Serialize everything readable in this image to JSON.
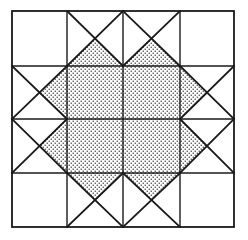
{
  "figure": {
    "name": "quilt-block-diagram",
    "canvas": {
      "width": 248,
      "height": 240
    },
    "background_color": "#ffffff",
    "line_color": "#1a1a1a",
    "fill_color": "#ffffff",
    "stipple_color": "#333333",
    "outer_line_width": 1.8,
    "grid_line_width": 1.4,
    "star_line_width": 1.8
  },
  "geometry": {
    "outer_square": {
      "left": 12,
      "top": 11,
      "right": 234,
      "bottom": 227
    },
    "grid_columns_x": [
      12,
      67,
      123,
      180,
      234
    ],
    "grid_rows_y": [
      11,
      66,
      119,
      173,
      227
    ],
    "center_x": 123,
    "center_y": 119,
    "star_center_square": {
      "left": 67,
      "top": 66,
      "right": 180,
      "bottom": 173
    },
    "star_points": [
      {
        "name": "point-top",
        "tip_x": 123,
        "tip_y": 11,
        "base_left_x": 67,
        "base_right_x": 180,
        "base_y": 66
      },
      {
        "name": "point-bottom",
        "tip_x": 123,
        "tip_y": 227,
        "base_left_x": 67,
        "base_right_x": 180,
        "base_y": 173
      },
      {
        "name": "point-left",
        "tip_x": 12,
        "tip_y": 119,
        "base_top_y": 66,
        "base_bottom_y": 173,
        "base_x": 67
      },
      {
        "name": "point-right",
        "tip_x": 234,
        "tip_y": 119,
        "base_top_y": 66,
        "base_bottom_y": 173,
        "base_x": 180
      }
    ],
    "notches": [
      {
        "name": "notch-top",
        "apex_x": 123,
        "apex_y": 66
      },
      {
        "name": "notch-bottom",
        "apex_x": 123,
        "apex_y": 173
      },
      {
        "name": "notch-left",
        "apex_x": 67,
        "apex_y": 119
      },
      {
        "name": "notch-right",
        "apex_x": 180,
        "apex_y": 119
      }
    ],
    "corner_patches": [
      {
        "name": "corner-top-left",
        "left": 12,
        "top": 11,
        "right": 67,
        "bottom": 66
      },
      {
        "name": "corner-top-right",
        "left": 180,
        "top": 11,
        "right": 234,
        "bottom": 66
      },
      {
        "name": "corner-bottom-left",
        "left": 12,
        "top": 173,
        "right": 67,
        "bottom": 227
      },
      {
        "name": "corner-bottom-right",
        "left": 180,
        "top": 173,
        "right": 234,
        "bottom": 227
      }
    ]
  },
  "shapes": {
    "star_body_path": "M 123 11 L 180 66 L 234 119 L 180 173 L 123 227 L 67 173 L 12 119 L 67 66 Z",
    "shaded_regions": [
      {
        "name": "star-octagon-body",
        "path": "M 123 11 L 180 66 L 234 119 L 180 173 L 123 227 L 67 173 L 12 119 L 67 66 Z",
        "shaded": true
      },
      {
        "name": "notch-top-cut",
        "path": "M 67 11 L 123 66 L 180 11 Z",
        "shaded": false
      },
      {
        "name": "notch-bottom-cut",
        "path": "M 67 227 L 123 173 L 180 227 Z",
        "shaded": false
      },
      {
        "name": "notch-left-cut",
        "path": "M 12 66 L 67 119 L 12 173 Z",
        "shaded": false
      },
      {
        "name": "notch-right-cut",
        "path": "M 234 66 L 180 119 L 234 173 Z",
        "shaded": false
      }
    ]
  },
  "grid_lines": [
    {
      "name": "outer-border",
      "type": "rect",
      "x1": 12,
      "y1": 11,
      "x2": 234,
      "y2": 227
    },
    {
      "name": "grid-vline-left",
      "type": "line",
      "x1": 67,
      "y1": 11,
      "x2": 67,
      "y2": 227
    },
    {
      "name": "grid-vline-center",
      "type": "line",
      "x1": 123,
      "y1": 11,
      "x2": 123,
      "y2": 227
    },
    {
      "name": "grid-vline-right",
      "type": "line",
      "x1": 180,
      "y1": 11,
      "x2": 180,
      "y2": 227
    },
    {
      "name": "grid-hline-top",
      "type": "line",
      "x1": 12,
      "y1": 66,
      "x2": 234,
      "y2": 66
    },
    {
      "name": "grid-hline-middle",
      "type": "line",
      "x1": 12,
      "y1": 119,
      "x2": 234,
      "y2": 119
    },
    {
      "name": "grid-hline-bottom",
      "type": "line",
      "x1": 12,
      "y1": 173,
      "x2": 234,
      "y2": 173
    }
  ],
  "diagonal_seams": [
    {
      "name": "seam-top-left-outer",
      "x1": 67,
      "y1": 11,
      "x2": 123,
      "y2": 66
    },
    {
      "name": "seam-top-right-outer",
      "x1": 180,
      "y1": 11,
      "x2": 123,
      "y2": 66
    },
    {
      "name": "seam-bottom-left-outer",
      "x1": 67,
      "y1": 227,
      "x2": 123,
      "y2": 173
    },
    {
      "name": "seam-bottom-right-outer",
      "x1": 180,
      "y1": 227,
      "x2": 123,
      "y2": 173
    },
    {
      "name": "seam-left-top-outer",
      "x1": 12,
      "y1": 66,
      "x2": 67,
      "y2": 119
    },
    {
      "name": "seam-left-bottom-outer",
      "x1": 12,
      "y1": 173,
      "x2": 67,
      "y2": 119
    },
    {
      "name": "seam-right-top-outer",
      "x1": 234,
      "y1": 66,
      "x2": 180,
      "y2": 119
    },
    {
      "name": "seam-right-bottom-outer",
      "x1": 234,
      "y1": 173,
      "x2": 180,
      "y2": 119
    }
  ]
}
